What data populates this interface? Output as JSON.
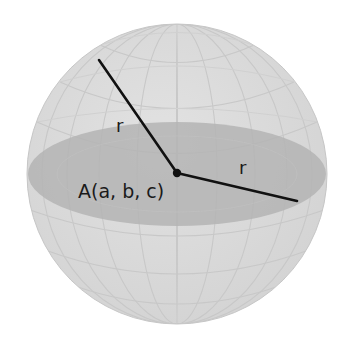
{
  "figure": {
    "center_label": "A(a, b, c)",
    "radius_labels": [
      "r",
      "r"
    ],
    "colors": {
      "background": "#ffffff",
      "sphere_fill": "#dadada",
      "sphere_edge": "#c4c4c4",
      "grid_line": "#c9c9c9",
      "equator_disc": "#b4b4b4",
      "radius_line": "#111111",
      "center_point": "#111111"
    }
  }
}
